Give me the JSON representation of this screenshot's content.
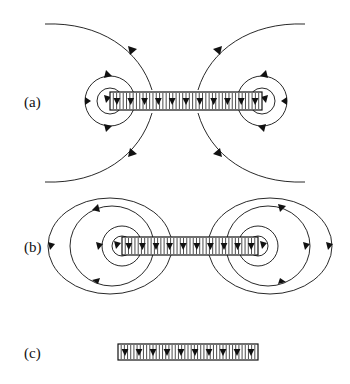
{
  "figure": {
    "background_color": "#ffffff",
    "line_color": "#111111",
    "width": 350,
    "height": 384
  },
  "panels": [
    {
      "id": "a",
      "label": "(a)",
      "label_x": 24,
      "label_y": 105,
      "description": "Flux tube with open external field lines extending beyond frame",
      "tube": {
        "x1": 110,
        "x2": 262,
        "cy": 101,
        "half_height": 9,
        "hatch_count": 46,
        "arrow_count": 11,
        "arrow_direction": "down"
      },
      "end_caps": [
        {
          "side": "left",
          "cx": 110,
          "cy": 101,
          "radii": [
            13,
            25
          ]
        },
        {
          "side": "right",
          "cx": 262,
          "cy": 101,
          "radii": [
            13,
            25
          ]
        }
      ],
      "outer_curves": 4
    },
    {
      "id": "b",
      "label": "(b)",
      "label_x": 24,
      "label_y": 250,
      "description": "Flux tube with closed nested elliptical field loops at each end",
      "tube": {
        "x1": 122,
        "x2": 258,
        "cy": 246,
        "half_height": 9,
        "hatch_count": 42,
        "arrow_count": 10,
        "arrow_direction": "down"
      },
      "end_caps": [
        {
          "side": "left",
          "cx": 122,
          "cy": 246,
          "radii": [
            10,
            20
          ]
        },
        {
          "side": "right",
          "cx": 258,
          "cy": 246,
          "radii": [
            10,
            20
          ]
        }
      ],
      "loops": [
        {
          "side": "left",
          "rx": 42,
          "ry": 40
        },
        {
          "side": "left",
          "rx": 70,
          "ry": 48
        },
        {
          "side": "right",
          "rx": 42,
          "ry": 40
        },
        {
          "side": "right",
          "rx": 70,
          "ry": 48
        }
      ]
    },
    {
      "id": "c",
      "label": "(c)",
      "label_x": 24,
      "label_y": 356,
      "description": "Flux tube alone with no external field lines",
      "tube": {
        "x1": 118,
        "x2": 258,
        "cy": 352,
        "half_height": 8,
        "hatch_count": 44,
        "arrow_count": 10,
        "arrow_direction": "down"
      }
    }
  ]
}
